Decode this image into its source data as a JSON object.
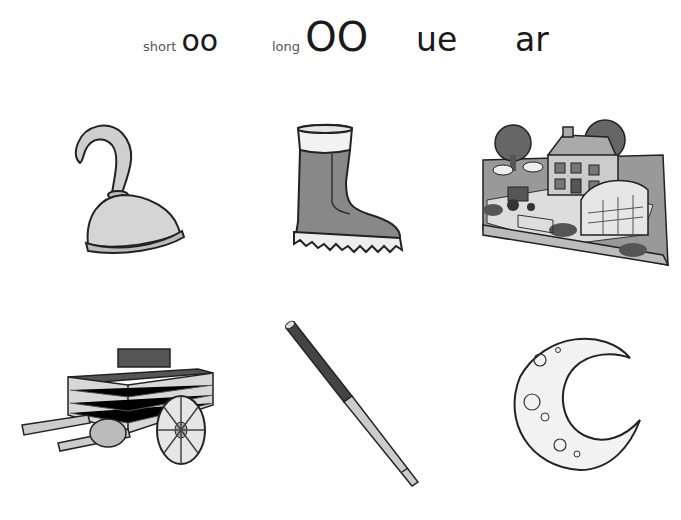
{
  "header": {
    "labels": [
      {
        "prefix": "short",
        "text": "oo"
      },
      {
        "prefix": "long",
        "text": "OO"
      },
      {
        "prefix": "",
        "text": "ue"
      },
      {
        "prefix": "",
        "text": "ar"
      }
    ]
  },
  "pictures": [
    {
      "name": "hook",
      "row": 1,
      "col": 1
    },
    {
      "name": "boot",
      "row": 1,
      "col": 2
    },
    {
      "name": "farm",
      "row": 1,
      "col": 3
    },
    {
      "name": "cart",
      "row": 2,
      "col": 1
    },
    {
      "name": "cue",
      "row": 2,
      "col": 2
    },
    {
      "name": "moon",
      "row": 2,
      "col": 3
    }
  ],
  "colors": {
    "ink": "#1a1a1a",
    "label_gray": "#555555",
    "fill_light": "#d8d8d8",
    "fill_mid": "#8a8a8a",
    "fill_dark": "#4a4a4a"
  }
}
